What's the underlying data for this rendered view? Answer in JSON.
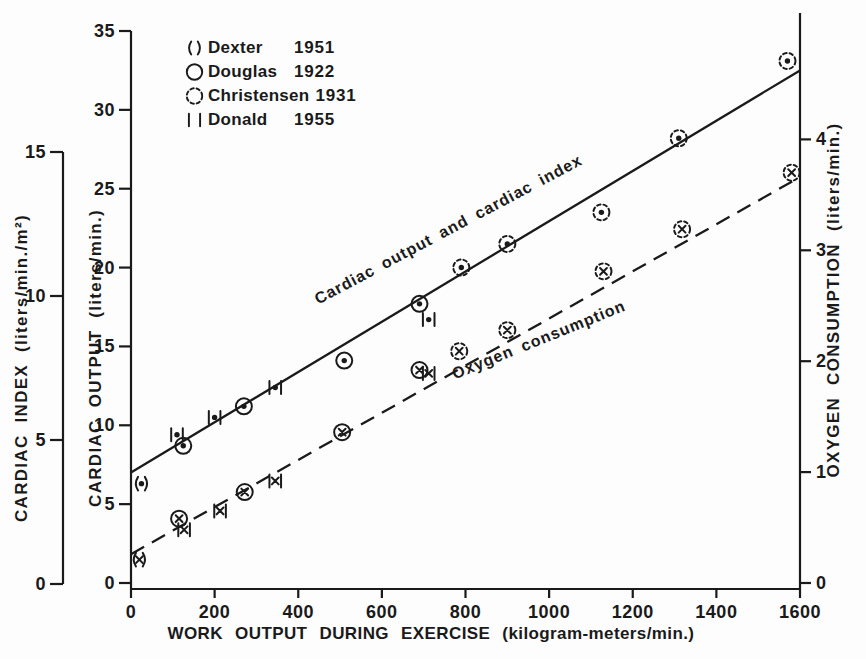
{
  "chart_data": {
    "type": "scatter",
    "title": "",
    "xlabel": "WORK OUTPUT DURING EXERCISE (kilogram-meters/min.)",
    "grid": false,
    "legend_position": "top-left",
    "axes": {
      "x": {
        "title": "WORK OUTPUT DURING EXERCISE  (kilogram-meters/min.)",
        "ticks": [
          0,
          200,
          400,
          600,
          800,
          1000,
          1200,
          1400,
          1600
        ],
        "range": [
          0,
          1600
        ]
      },
      "cardiac_index": {
        "title": "CARDIAC INDEX  (liters/min./m²)",
        "ticks": [
          0,
          5,
          10,
          15
        ],
        "range": [
          0,
          15
        ],
        "side": "far-left"
      },
      "cardiac_output": {
        "title": "CARDIAC OUTPUT  (liters/min.)",
        "ticks": [
          0,
          5,
          10,
          15,
          20,
          25,
          30,
          35
        ],
        "range": [
          0,
          35
        ],
        "side": "left"
      },
      "oxygen": {
        "title": "OXYGEN CONSUMPTION  (liters/min.)",
        "ticks": [
          0,
          1,
          2,
          3,
          4
        ],
        "range": [
          0,
          4.6
        ],
        "side": "right"
      }
    },
    "studies": [
      {
        "name": "Dexter",
        "year": "1951",
        "marker": "parentheses"
      },
      {
        "name": "Douglas",
        "year": "1922",
        "marker": "circle"
      },
      {
        "name": "Christensen",
        "year": "1931",
        "marker": "dashed-circle"
      },
      {
        "name": "Donald",
        "year": "1955",
        "marker": "bars"
      }
    ],
    "series": [
      {
        "name": "Cardiac output and cardiac index",
        "yaxis": "cardiac_output",
        "symbol": "dot",
        "line": "solid",
        "trend_line": [
          [
            0,
            7.0
          ],
          [
            1600,
            32.5
          ]
        ],
        "points": [
          {
            "x": 25,
            "y": 6.3,
            "study": "Dexter"
          },
          {
            "x": 110,
            "y": 9.4,
            "study": "Donald"
          },
          {
            "x": 125,
            "y": 8.7,
            "study": "Douglas"
          },
          {
            "x": 200,
            "y": 10.5,
            "study": "Donald"
          },
          {
            "x": 270,
            "y": 11.2,
            "study": "Douglas"
          },
          {
            "x": 345,
            "y": 12.4,
            "study": "Donald"
          },
          {
            "x": 510,
            "y": 14.1,
            "study": "Douglas"
          },
          {
            "x": 690,
            "y": 17.7,
            "study": "Douglas"
          },
          {
            "x": 712,
            "y": 16.7,
            "study": "Donald"
          },
          {
            "x": 790,
            "y": 20.0,
            "study": "Christensen"
          },
          {
            "x": 900,
            "y": 21.5,
            "study": "Christensen"
          },
          {
            "x": 1125,
            "y": 23.5,
            "study": "Christensen"
          },
          {
            "x": 1310,
            "y": 28.2,
            "study": "Christensen"
          },
          {
            "x": 1570,
            "y": 33.1,
            "study": "Christensen"
          }
        ]
      },
      {
        "name": "Oxygen consumption",
        "yaxis": "oxygen",
        "symbol": "x",
        "line": "dashed",
        "trend_line": [
          [
            0,
            0.26
          ],
          [
            1600,
            3.66
          ]
        ],
        "points": [
          {
            "x": 20,
            "y": 0.21,
            "study": "Dexter"
          },
          {
            "x": 115,
            "y": 0.58,
            "study": "Douglas"
          },
          {
            "x": 127,
            "y": 0.48,
            "study": "Donald"
          },
          {
            "x": 213,
            "y": 0.65,
            "study": "Donald"
          },
          {
            "x": 272,
            "y": 0.82,
            "study": "Douglas"
          },
          {
            "x": 345,
            "y": 0.92,
            "study": "Donald"
          },
          {
            "x": 505,
            "y": 1.36,
            "study": "Douglas"
          },
          {
            "x": 690,
            "y": 1.92,
            "study": "Douglas"
          },
          {
            "x": 712,
            "y": 1.89,
            "study": "Donald"
          },
          {
            "x": 785,
            "y": 2.09,
            "study": "Christensen"
          },
          {
            "x": 900,
            "y": 2.28,
            "study": "Christensen"
          },
          {
            "x": 1130,
            "y": 2.81,
            "study": "Christensen"
          },
          {
            "x": 1318,
            "y": 3.19,
            "study": "Christensen"
          },
          {
            "x": 1580,
            "y": 3.7,
            "study": "Christensen"
          }
        ]
      }
    ],
    "colors": {
      "ink": "#1a1a1a",
      "background": "#fdfdfd"
    }
  }
}
